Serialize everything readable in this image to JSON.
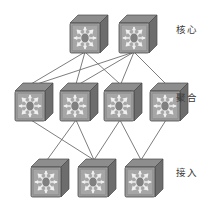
{
  "diagram": {
    "title": "",
    "type": "network-topology",
    "background_color": "#ffffff",
    "tiers": [
      {
        "id": "core",
        "label": "核心",
        "label_en": "Core",
        "node_count": 2,
        "label_position": {
          "x": 176,
          "y": 24
        }
      },
      {
        "id": "aggregation",
        "label": "聚合",
        "label_en": "Aggregation",
        "node_count": 4,
        "label_position": {
          "x": 176,
          "y": 92
        }
      },
      {
        "id": "access",
        "label": "接入",
        "label_en": "Access",
        "node_count": 3,
        "label_position": {
          "x": 176,
          "y": 167
        }
      }
    ],
    "nodes": [
      {
        "id": "core-1",
        "tier": "core",
        "icon": "network-switch-icon",
        "x": 67,
        "y": 14
      },
      {
        "id": "core-2",
        "tier": "core",
        "icon": "network-switch-icon",
        "x": 116,
        "y": 14
      },
      {
        "id": "aggr-1",
        "tier": "aggregation",
        "icon": "network-switch-icon",
        "x": 12,
        "y": 82
      },
      {
        "id": "aggr-2",
        "tier": "aggregation",
        "icon": "network-switch-icon",
        "x": 57,
        "y": 82
      },
      {
        "id": "aggr-3",
        "tier": "aggregation",
        "icon": "network-switch-icon",
        "x": 101,
        "y": 82
      },
      {
        "id": "aggr-4",
        "tier": "aggregation",
        "icon": "network-switch-icon",
        "x": 147,
        "y": 82
      },
      {
        "id": "access-1",
        "tier": "access",
        "icon": "network-switch-icon",
        "x": 28,
        "y": 158
      },
      {
        "id": "access-2",
        "tier": "access",
        "icon": "network-switch-icon",
        "x": 75,
        "y": 158
      },
      {
        "id": "access-3",
        "tier": "access",
        "icon": "network-switch-icon",
        "x": 122,
        "y": 158
      }
    ],
    "links": [
      {
        "from": "core-1",
        "to": "aggr-1"
      },
      {
        "from": "core-1",
        "to": "aggr-2"
      },
      {
        "from": "core-1",
        "to": "aggr-3"
      },
      {
        "from": "core-2",
        "to": "aggr-1"
      },
      {
        "from": "core-2",
        "to": "aggr-2"
      },
      {
        "from": "core-2",
        "to": "aggr-3"
      },
      {
        "from": "core-2",
        "to": "aggr-4"
      },
      {
        "from": "aggr-1",
        "to": "access-2"
      },
      {
        "from": "aggr-2",
        "to": "access-1"
      },
      {
        "from": "aggr-2",
        "to": "access-2"
      },
      {
        "from": "aggr-3",
        "to": "access-2"
      },
      {
        "from": "aggr-3",
        "to": "access-3"
      },
      {
        "from": "aggr-4",
        "to": "access-3"
      }
    ],
    "colors": {
      "link": "#6e6e6e",
      "node_face": "#9a9a9a",
      "node_face_light": "#b4b4b4",
      "node_side": "#6d6d6d",
      "node_top": "#8a8a8a",
      "node_outline": "#4a4a4a",
      "node_glyph": "#efefef",
      "label_text": "#3b3b3b",
      "background": "#ffffff"
    },
    "node_size": {
      "width": 42,
      "height": 40
    }
  }
}
